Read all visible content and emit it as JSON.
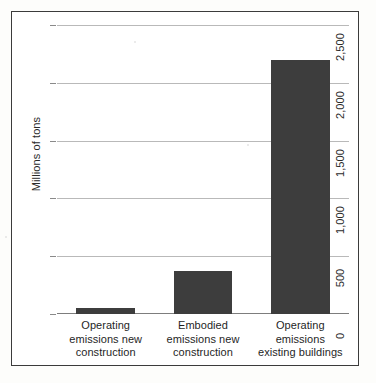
{
  "chart_data": {
    "type": "bar",
    "title": "",
    "xlabel": "",
    "ylabel": "Millions of tons",
    "categories": [
      "Operating emissions new construction",
      "Embodied emissions new construction",
      "Operating emissions existing buildings"
    ],
    "category_lines": [
      [
        "Operating",
        "emissions new",
        "construction"
      ],
      [
        "Embodied",
        "emissions new",
        "construction"
      ],
      [
        "Operating",
        "emissions",
        "existing buildings"
      ]
    ],
    "values": [
      50,
      370,
      2200
    ],
    "ylim": [
      0,
      2500
    ],
    "yticks": [
      0,
      500,
      1000,
      1500,
      2000,
      2500
    ],
    "ytick_labels": [
      "0",
      "500",
      "1,000",
      "1,500",
      "2,000",
      "2,500"
    ],
    "grid": true,
    "legend": "none",
    "bar_color": "#3d3d3d",
    "grid_color": "#b9b9b9",
    "axis_color": "#7d7d7d",
    "frame_color": "#3b3b3b"
  }
}
